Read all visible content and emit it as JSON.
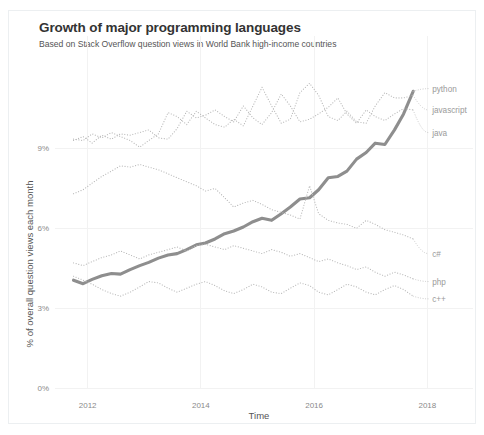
{
  "card": {
    "title": "Growth of major programming languages",
    "subtitle": "Based on Stack Overflow question views in World Bank high-income countries"
  },
  "chart_data": {
    "type": "line",
    "title": "Growth of major programming languages",
    "subtitle": "Based on Stack Overflow question views in World Bank high-income countries",
    "xlabel": "Time",
    "ylabel": "% of overall question views each month",
    "xlim": [
      2011.6,
      2018.1
    ],
    "ylim": [
      0,
      12.1
    ],
    "xticks": [
      2012,
      2014,
      2016,
      2018
    ],
    "xticklabels": [
      "2012",
      "2014",
      "2016",
      "2018"
    ],
    "yticks": [
      0,
      3,
      6,
      9
    ],
    "yticklabels": [
      "0%",
      "3%",
      "6%",
      "9%"
    ],
    "grid": true,
    "legend_position": "right-inline-labels",
    "accent_color": "#8e8e8e",
    "dotted_color": "#b9b9b9",
    "series": [
      {
        "name": "python",
        "style": "solid",
        "color": "#8e8e8e",
        "label_x": 2018.05,
        "label_y": 11.25,
        "x": [
          2011.75,
          2011.92,
          2012.08,
          2012.25,
          2012.42,
          2012.58,
          2012.75,
          2012.92,
          2013.08,
          2013.25,
          2013.42,
          2013.58,
          2013.75,
          2013.92,
          2014.08,
          2014.25,
          2014.42,
          2014.58,
          2014.75,
          2014.92,
          2015.08,
          2015.25,
          2015.42,
          2015.58,
          2015.75,
          2015.92,
          2016.08,
          2016.25,
          2016.42,
          2016.58,
          2016.75,
          2016.92,
          2017.08,
          2017.25,
          2017.42,
          2017.58,
          2017.75
        ],
        "values": [
          4.05,
          3.92,
          4.08,
          4.22,
          4.3,
          4.28,
          4.45,
          4.6,
          4.72,
          4.88,
          5.0,
          5.05,
          5.2,
          5.38,
          5.45,
          5.6,
          5.8,
          5.9,
          6.05,
          6.25,
          6.38,
          6.3,
          6.55,
          6.8,
          7.1,
          7.15,
          7.45,
          7.9,
          7.95,
          8.15,
          8.6,
          8.85,
          9.2,
          9.15,
          9.7,
          10.3,
          11.15
        ]
      },
      {
        "name": "javascript",
        "style": "dotted",
        "color": "#b9b9b9",
        "label_x": 2018.05,
        "label_y": 10.45,
        "x": [
          2011.75,
          2011.92,
          2012.08,
          2012.25,
          2012.42,
          2012.58,
          2012.75,
          2012.92,
          2013.08,
          2013.25,
          2013.42,
          2013.58,
          2013.75,
          2013.92,
          2014.08,
          2014.25,
          2014.42,
          2014.58,
          2014.75,
          2014.92,
          2015.08,
          2015.25,
          2015.42,
          2015.58,
          2015.75,
          2015.92,
          2016.08,
          2016.25,
          2016.42,
          2016.58,
          2016.75,
          2016.92,
          2017.08,
          2017.25,
          2017.42,
          2017.58,
          2017.75
        ],
        "values": [
          9.35,
          9.3,
          9.55,
          9.4,
          9.6,
          9.45,
          9.3,
          9.05,
          9.3,
          9.55,
          10.35,
          10.2,
          9.9,
          10.4,
          10.15,
          9.9,
          9.8,
          10.1,
          9.85,
          10.6,
          11.3,
          10.6,
          9.95,
          10.1,
          11.1,
          11.45,
          11.0,
          10.2,
          10.05,
          10.4,
          10.0,
          9.95,
          10.6,
          11.1,
          10.9,
          10.9,
          11.0
        ]
      },
      {
        "name": "java",
        "style": "dotted",
        "color": "#b9b9b9",
        "label_x": 2018.05,
        "label_y": 9.6,
        "x": [
          2011.75,
          2011.92,
          2012.08,
          2012.25,
          2012.42,
          2012.58,
          2012.75,
          2012.92,
          2013.08,
          2013.25,
          2013.42,
          2013.58,
          2013.75,
          2013.92,
          2014.08,
          2014.25,
          2014.42,
          2014.58,
          2014.75,
          2014.92,
          2015.08,
          2015.25,
          2015.42,
          2015.58,
          2015.75,
          2015.92,
          2016.08,
          2016.25,
          2016.42,
          2016.58,
          2016.75,
          2016.92,
          2017.08,
          2017.25,
          2017.42,
          2017.58,
          2017.75
        ],
        "values": [
          9.3,
          9.45,
          9.2,
          9.5,
          9.35,
          9.55,
          9.5,
          9.6,
          9.7,
          9.4,
          9.35,
          9.75,
          10.4,
          10.15,
          10.25,
          10.45,
          10.2,
          10.0,
          10.6,
          10.15,
          9.9,
          10.35,
          11.05,
          10.6,
          10.0,
          10.1,
          10.3,
          10.55,
          10.9,
          10.3,
          9.95,
          10.45,
          10.2,
          10.05,
          10.3,
          10.5,
          10.45
        ]
      },
      {
        "name": "c#",
        "style": "dotted",
        "color": "#b9b9b9",
        "label_x": 2018.05,
        "label_y": 5.05,
        "x": [
          2011.75,
          2011.92,
          2012.08,
          2012.25,
          2012.42,
          2012.58,
          2012.75,
          2012.92,
          2013.08,
          2013.25,
          2013.42,
          2013.58,
          2013.75,
          2013.92,
          2014.08,
          2014.25,
          2014.42,
          2014.58,
          2014.75,
          2014.92,
          2015.08,
          2015.25,
          2015.42,
          2015.58,
          2015.75,
          2015.92,
          2016.08,
          2016.25,
          2016.42,
          2016.58,
          2016.75,
          2016.92,
          2017.08,
          2017.25,
          2017.42,
          2017.58,
          2017.75
        ],
        "values": [
          7.3,
          7.45,
          7.7,
          7.95,
          8.15,
          8.35,
          8.3,
          8.4,
          8.3,
          8.2,
          8.05,
          7.9,
          7.75,
          7.6,
          7.4,
          7.5,
          7.15,
          6.8,
          6.95,
          7.05,
          6.9,
          6.7,
          6.6,
          6.5,
          6.35,
          7.6,
          6.55,
          6.3,
          6.2,
          6.15,
          6.0,
          6.3,
          6.15,
          5.95,
          5.85,
          5.75,
          5.6
        ]
      },
      {
        "name": "php",
        "style": "dotted",
        "color": "#b9b9b9",
        "label_x": 2018.05,
        "label_y": 4.0,
        "x": [
          2011.75,
          2011.92,
          2012.08,
          2012.25,
          2012.42,
          2012.58,
          2012.75,
          2012.92,
          2013.08,
          2013.25,
          2013.42,
          2013.58,
          2013.75,
          2013.92,
          2014.08,
          2014.25,
          2014.42,
          2014.58,
          2014.75,
          2014.92,
          2015.08,
          2015.25,
          2015.42,
          2015.58,
          2015.75,
          2015.92,
          2016.08,
          2016.25,
          2016.42,
          2016.58,
          2016.75,
          2016.92,
          2017.08,
          2017.25,
          2017.42,
          2017.58,
          2017.75
        ],
        "values": [
          4.7,
          4.6,
          4.75,
          4.9,
          5.0,
          5.15,
          5.0,
          4.85,
          5.0,
          5.1,
          5.2,
          5.3,
          5.15,
          5.35,
          5.4,
          5.3,
          5.2,
          5.35,
          5.25,
          5.15,
          5.05,
          5.2,
          5.1,
          4.95,
          5.05,
          4.9,
          4.75,
          4.85,
          4.7,
          4.6,
          4.45,
          4.55,
          4.35,
          4.2,
          4.35,
          4.25,
          4.1
        ]
      },
      {
        "name": "c++",
        "style": "dotted",
        "color": "#b9b9b9",
        "label_x": 2018.05,
        "label_y": 3.35,
        "x": [
          2011.75,
          2011.92,
          2012.08,
          2012.25,
          2012.42,
          2012.58,
          2012.75,
          2012.92,
          2013.08,
          2013.25,
          2013.42,
          2013.58,
          2013.75,
          2013.92,
          2014.08,
          2014.25,
          2014.42,
          2014.58,
          2014.75,
          2014.92,
          2015.08,
          2015.25,
          2015.42,
          2015.58,
          2015.75,
          2015.92,
          2016.08,
          2016.25,
          2016.42,
          2016.58,
          2016.75,
          2016.92,
          2017.08,
          2017.25,
          2017.42,
          2017.58,
          2017.75
        ],
        "values": [
          4.2,
          4.05,
          3.9,
          3.7,
          3.55,
          3.45,
          3.6,
          3.8,
          4.0,
          3.95,
          3.75,
          3.6,
          3.75,
          3.9,
          4.0,
          3.85,
          3.65,
          3.55,
          3.7,
          3.9,
          3.8,
          3.6,
          3.55,
          3.75,
          3.95,
          3.85,
          3.6,
          3.5,
          3.7,
          3.9,
          3.8,
          3.6,
          3.5,
          3.7,
          3.85,
          3.7,
          3.45
        ]
      }
    ]
  }
}
